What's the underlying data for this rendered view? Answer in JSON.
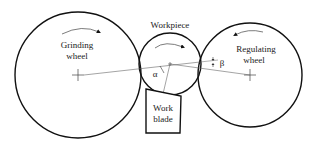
{
  "diagram": {
    "type": "centerless-grinding-schematic",
    "colors": {
      "stroke": "#111111",
      "thin_line": "#555555",
      "text": "#222222",
      "background": "#ffffff"
    },
    "components": {
      "grinding_wheel": {
        "label_line1": "Grinding",
        "label_line2": "wheel",
        "rotation": "clockwise"
      },
      "workpiece": {
        "label": "Workpiece",
        "rotation": "clockwise"
      },
      "regulating_wheel": {
        "label_line1": "Regulating",
        "label_line2": "wheel",
        "rotation": "counter-clockwise"
      },
      "work_blade": {
        "label_line1": "Work",
        "label_line2": "blade"
      }
    },
    "angles": {
      "alpha": "α",
      "beta": "β"
    }
  }
}
